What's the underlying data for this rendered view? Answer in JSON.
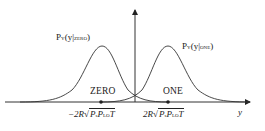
{
  "diagram": {
    "type": "two-gaussian-decision-diagram",
    "curves": [
      {
        "name": "zero",
        "label_main": "P",
        "label_sub1": "Y",
        "label_arg": "(y|",
        "label_sub2": "ZERO",
        "label_close": ")",
        "symbol": "ZERO",
        "mean_label_prefix": "−2R",
        "center_x": 101
      },
      {
        "name": "one",
        "label_main": "P",
        "label_sub1": "Y",
        "label_arg": "(y|",
        "label_sub2": "ONE",
        "label_close": ")",
        "symbol": "ONE",
        "mean_label_prefix": "2R",
        "center_x": 168
      }
    ],
    "formula": {
      "p": "P",
      "s": "s",
      "p2": "P",
      "lo": "LO",
      "t": "T"
    },
    "x_axis_label": "y",
    "colors": {
      "line": "#333333",
      "background": "#ffffff"
    }
  }
}
